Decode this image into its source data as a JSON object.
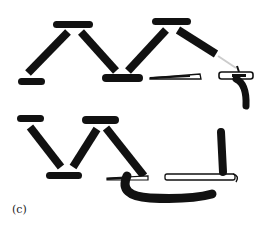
{
  "figure": {
    "label": "(c)",
    "ink_color": "#111111",
    "background": "#ffffff",
    "top_row": {
      "description": "folded zigzag of black bars with a thin blade and a hooked handle on the right"
    },
    "bottom_row": {
      "description": "zigzag of black bars with a thin blade connected by a curved stroke to a vertical bar and hook"
    }
  }
}
